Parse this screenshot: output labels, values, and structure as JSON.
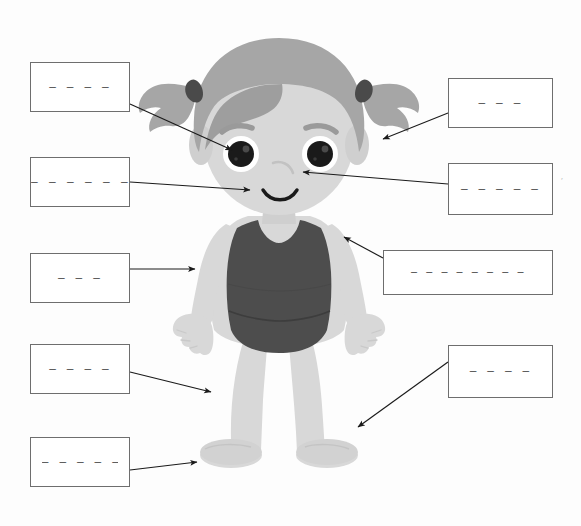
{
  "page": {
    "background_color": "#fdfdfd",
    "width": 581,
    "height": 526
  },
  "figure": {
    "name": "cartoon-girl",
    "colors": {
      "skin": "#d8d8d8",
      "skin_shadow": "#c9c9c9",
      "hair": "#a6a6a6",
      "hair_shadow": "#9a9a9a",
      "hair_tie": "#4a4a4a",
      "swimsuit": "#4d4d4d",
      "eye": "#1a1a1a",
      "eye_white": "#ffffff",
      "eyebrow": "#9a9a9a",
      "mouth": "#1a1a1a",
      "outline": "#6e6e6e",
      "arrow": "#1a1a1a"
    },
    "parts": [
      "hair",
      "pigtail-left",
      "pigtail-right",
      "eyebrow-left",
      "eyebrow-right",
      "eye-left",
      "eye-right",
      "nose",
      "mouth",
      "ear-left",
      "ear-right",
      "neck",
      "shoulder",
      "arm-left",
      "arm-right",
      "hand-left",
      "hand-right",
      "swimsuit",
      "leg-left",
      "leg-right",
      "foot-left",
      "foot-right"
    ]
  },
  "answer_boxes": [
    {
      "id": "box-left-1",
      "side": "left",
      "blank_line": "—  —  —  —",
      "x": 30,
      "y": 62,
      "w": 100,
      "h": 50,
      "line_style": "centered",
      "arrow": {
        "from_x": 130,
        "from_y": 104,
        "to_x": 235,
        "to_y": 152
      },
      "points_to": "eye-left"
    },
    {
      "id": "box-left-2",
      "side": "left",
      "blank_line": "— — — — — —",
      "x": 30,
      "y": 157,
      "w": 100,
      "h": 50,
      "line_style": "full",
      "arrow": {
        "from_x": 130,
        "from_y": 182,
        "to_x": 253,
        "to_y": 190
      },
      "points_to": "mouth"
    },
    {
      "id": "box-left-3",
      "side": "left",
      "blank_line": "—  —  —",
      "x": 30,
      "y": 253,
      "w": 100,
      "h": 50,
      "line_style": "centered",
      "arrow": {
        "from_x": 130,
        "from_y": 269,
        "to_x": 198,
        "to_y": 269
      },
      "points_to": "arm-left"
    },
    {
      "id": "box-left-4",
      "side": "left",
      "blank_line": "—  —  —  —",
      "x": 30,
      "y": 344,
      "w": 100,
      "h": 50,
      "line_style": "centered",
      "arrow": {
        "from_x": 130,
        "from_y": 372,
        "to_x": 214,
        "to_y": 394
      },
      "points_to": "leg-left"
    },
    {
      "id": "box-left-5",
      "side": "left",
      "blank_line": "—  —  —  —  —",
      "x": 30,
      "y": 437,
      "w": 100,
      "h": 50,
      "line_style": "centered",
      "arrow": {
        "from_x": 130,
        "from_y": 470,
        "to_x": 200,
        "to_y": 462
      },
      "points_to": "foot-left"
    },
    {
      "id": "box-right-1",
      "side": "right",
      "blank_line": "—  —  —",
      "x": 448,
      "y": 78,
      "w": 105,
      "h": 50,
      "line_style": "centered",
      "arrow": {
        "from_x": 448,
        "from_y": 113,
        "to_x": 380,
        "to_y": 140
      },
      "points_to": "ear-right"
    },
    {
      "id": "box-right-2",
      "side": "right",
      "blank_line": "—  —  —  —  —",
      "x": 448,
      "y": 163,
      "w": 105,
      "h": 52,
      "line_style": "centered",
      "arrow": {
        "from_x": 448,
        "from_y": 184,
        "to_x": 300,
        "to_y": 172
      },
      "points_to": "nose"
    },
    {
      "id": "box-right-3",
      "side": "right",
      "blank_line": "— — — — — — — —",
      "x": 383,
      "y": 250,
      "w": 170,
      "h": 45,
      "line_style": "wide",
      "arrow": {
        "from_x": 383,
        "from_y": 258,
        "to_x": 341,
        "to_y": 236
      },
      "points_to": "shoulder"
    },
    {
      "id": "box-right-4",
      "side": "right",
      "blank_line": "—  —  —  —",
      "x": 448,
      "y": 345,
      "w": 105,
      "h": 53,
      "line_style": "centered",
      "arrow": {
        "from_x": 448,
        "from_y": 362,
        "to_x": 355,
        "to_y": 430
      },
      "points_to": "foot-right"
    }
  ],
  "marks": [
    {
      "id": "stray-mark-right",
      "glyph": "′",
      "x": 561,
      "y": 182
    }
  ]
}
